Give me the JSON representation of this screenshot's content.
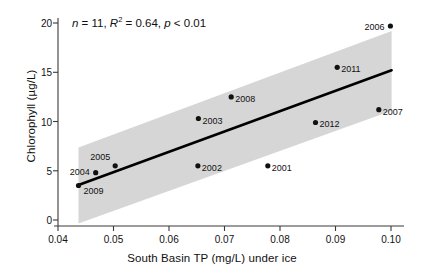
{
  "chart_data": {
    "type": "scatter",
    "title": "",
    "xlabel": "South Basin TP (mg/L) under ice",
    "ylabel": "Chlorophyll (µg/L)",
    "xlim": [
      0.0405,
      0.1025
    ],
    "ylim": [
      -1.0,
      20.8
    ],
    "xticks": [
      "0.04",
      "0.05",
      "0.06",
      "0.07",
      "0.08",
      "0.09",
      "0.10"
    ],
    "xtick_values": [
      0.04,
      0.05,
      0.06,
      0.07,
      0.08,
      0.09,
      0.1
    ],
    "yticks": [
      "0",
      "5",
      "10",
      "15",
      "20"
    ],
    "ytick_values": [
      0,
      5,
      10,
      15,
      20
    ],
    "grid": false,
    "legend": false,
    "point_color": "#111111",
    "line_color": "#000000",
    "band_color": "#d4d4d4",
    "points": [
      {
        "label": "2009",
        "x": 0.0437,
        "y": 3.5,
        "label_dx": 5,
        "label_dy": 9
      },
      {
        "label": "2004",
        "x": 0.0468,
        "y": 4.8,
        "label_dx": -26,
        "label_dy": 3
      },
      {
        "label": "2005",
        "x": 0.0503,
        "y": 5.5,
        "label_dx": -25,
        "label_dy": -5
      },
      {
        "label": "2002",
        "x": 0.0652,
        "y": 5.5,
        "label_dx": 4,
        "label_dy": 6
      },
      {
        "label": "2003",
        "x": 0.0653,
        "y": 10.3,
        "label_dx": 4,
        "label_dy": 6
      },
      {
        "label": "2008",
        "x": 0.0712,
        "y": 12.5,
        "label_dx": 4,
        "label_dy": 6
      },
      {
        "label": "2001",
        "x": 0.0778,
        "y": 5.5,
        "label_dx": 4,
        "label_dy": 6
      },
      {
        "label": "2012",
        "x": 0.0864,
        "y": 9.9,
        "label_dx": 4,
        "label_dy": 6
      },
      {
        "label": "2011",
        "x": 0.0903,
        "y": 15.5,
        "label_dx": 4,
        "label_dy": 6
      },
      {
        "label": "2007",
        "x": 0.0978,
        "y": 11.2,
        "label_dx": 4,
        "label_dy": 6
      },
      {
        "label": "2006",
        "x": 0.0999,
        "y": 19.7,
        "label_dx": -26,
        "label_dy": 5
      }
    ],
    "fit_line": {
      "x_start": 0.0437,
      "y_start": 3.55,
      "x_end": 0.1001,
      "y_end": 15.2
    },
    "confidence_band": {
      "x_start": 0.0437,
      "x_end": 0.1001,
      "upper_start": 7.35,
      "upper_end": 19.2,
      "lower_start": -0.35,
      "lower_end": 11.1
    },
    "annotation": {
      "n_label": "n",
      "n_value": "= 11,",
      "r2_label": "R",
      "r2_sup": "2",
      "r2_value": "= 0.64,",
      "p_label": "p",
      "p_value": "< 0.01"
    }
  }
}
